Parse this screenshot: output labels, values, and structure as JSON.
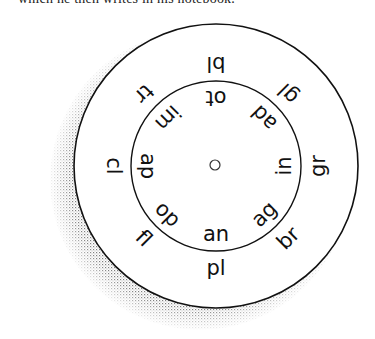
{
  "caption": "which he then writes in his notebook.",
  "wheel": {
    "center": [
      216,
      166
    ],
    "outer_radius": 142,
    "inner_radius": 85,
    "hub_radius": 5,
    "outer_labels": [
      {
        "text": "bl",
        "angle": 180
      },
      {
        "text": "gl",
        "angle": 225
      },
      {
        "text": "gr",
        "angle": 270
      },
      {
        "text": "br",
        "angle": 315
      },
      {
        "text": "pl",
        "angle": 0
      },
      {
        "text": "fl",
        "angle": 45
      },
      {
        "text": "cl",
        "angle": 90
      },
      {
        "text": "tr",
        "angle": 135
      }
    ],
    "inner_labels": [
      {
        "text": "ot",
        "angle": 180
      },
      {
        "text": "ad",
        "angle": 225
      },
      {
        "text": "in",
        "angle": 270
      },
      {
        "text": "ag",
        "angle": 315
      },
      {
        "text": "an",
        "angle": 0
      },
      {
        "text": "op",
        "angle": 45
      },
      {
        "text": "ap",
        "angle": 90
      },
      {
        "text": "im",
        "angle": 135
      }
    ]
  }
}
